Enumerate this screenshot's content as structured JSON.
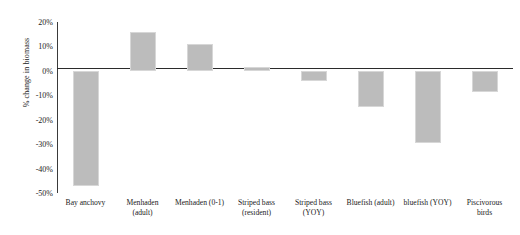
{
  "chart_data": {
    "type": "bar",
    "title": "",
    "xlabel": "",
    "ylabel": "% change in biomass",
    "ylim": [
      -50,
      20
    ],
    "grid": false,
    "legend": "none",
    "zero_line": true,
    "bar_color": "#bcbcbc",
    "bar_edge_color": "#d7d7d7",
    "axis_color": "#2b2b2b",
    "ytick_labels": [
      "20%",
      "10%",
      "0%",
      "-10%",
      "-20%",
      "-30%",
      "-40%",
      "-50%"
    ],
    "ytick_values": [
      20,
      10,
      0,
      -10,
      -20,
      -30,
      -40,
      -50
    ],
    "categories": [
      "Bay anchovy",
      "Menhaden\n(adult)",
      "Menhaden (0-1)",
      "Striped bass\n(resident)",
      "Striped bass\n(YOY)",
      "Bluefish (adult)",
      "bluefish (YOY)",
      "Piscivorous\nbirds"
    ],
    "values": [
      -47,
      16,
      11,
      1.5,
      -4,
      -15,
      -29.5,
      -8.5
    ],
    "bars": [
      {
        "category": "Bay anchovy",
        "value": -47
      },
      {
        "category": "Menhaden (adult)",
        "value": 16
      },
      {
        "category": "Menhaden (0-1)",
        "value": 11
      },
      {
        "category": "Striped bass (resident)",
        "value": 1.5
      },
      {
        "category": "Striped bass (YOY)",
        "value": -4
      },
      {
        "category": "Bluefish (adult)",
        "value": -15
      },
      {
        "category": "bluefish (YOY)",
        "value": -29.5
      },
      {
        "category": "Piscivorous birds",
        "value": -8.5
      }
    ]
  }
}
